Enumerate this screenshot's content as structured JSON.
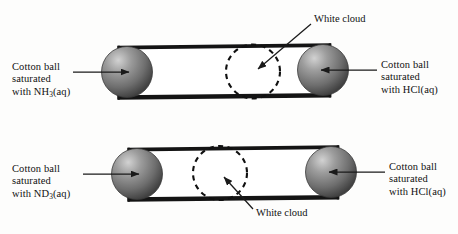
{
  "figure": {
    "background_color": "#fdfdfc",
    "ink_color": "#111111"
  },
  "panels": [
    {
      "id": "panel-top",
      "left_label": {
        "line1": "Cotton ball",
        "line2": "saturated",
        "line3_prefix": "with NH",
        "line3_sub": "3",
        "line3_suffix": "(aq)"
      },
      "right_label": {
        "line1": "Cotton ball",
        "line2": "saturated",
        "line3_prefix": "with HCl",
        "line3_sub": "",
        "line3_suffix": "(aq)"
      },
      "cloud_label": "White cloud",
      "cloud_label_position": "above-right",
      "cloud_center_x": 253,
      "cloud_radius": 27
    },
    {
      "id": "panel-bottom",
      "left_label": {
        "line1": "Cotton ball",
        "line2": "saturated",
        "line3_prefix": "with ND",
        "line3_sub": "3",
        "line3_suffix": "(aq)"
      },
      "right_label": {
        "line1": "Cotton ball",
        "line2": "saturated",
        "line3_prefix": "with HCl",
        "line3_sub": "",
        "line3_suffix": "(aq)"
      },
      "cloud_label": "White cloud",
      "cloud_label_position": "below-left",
      "cloud_center_x": 220,
      "cloud_radius": 27
    }
  ],
  "colors": {
    "tube_stroke": "#141414",
    "tube_interior": "#ffffff",
    "sphere_dark": "#4a4a4a",
    "sphere_mid": "#7b7b7b",
    "sphere_light": "#c9c9c9",
    "dashed_circle": "#101010",
    "leader_line": "#1a1a1a"
  }
}
